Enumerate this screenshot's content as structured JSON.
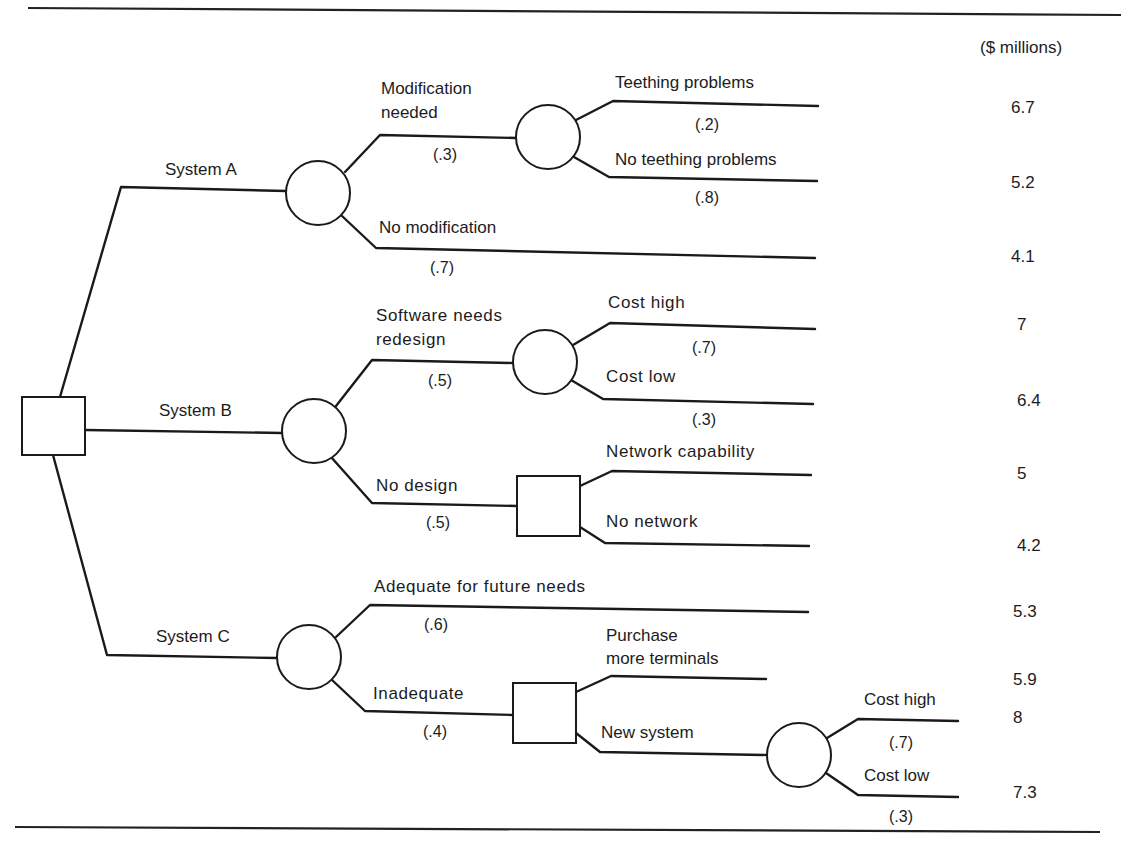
{
  "figure": {
    "units_label": "($ millions)",
    "title_visible": false
  },
  "root": {
    "type": "decision",
    "name": "Root decision"
  },
  "branches": {
    "system_a": {
      "label": "System A",
      "modification_needed": {
        "label": "Modification needed",
        "label_line1": "Modification",
        "label_line2": "needed",
        "prob": "(.3)",
        "teething": {
          "label": "Teething problems",
          "prob": "(.2)",
          "value": "6.7"
        },
        "no_teething": {
          "label": "No teething problems",
          "prob": "(.8)",
          "value": "5.2"
        }
      },
      "no_modification": {
        "label": "No modification",
        "prob": "(.7)",
        "value": "4.1"
      }
    },
    "system_b": {
      "label": "System B",
      "software_redesign": {
        "label_line1": "Software needs",
        "label_line2": "redesign",
        "prob": "(.5)",
        "cost_high": {
          "label": "Cost high",
          "prob": "(.7)",
          "value": "7"
        },
        "cost_low": {
          "label": "Cost low",
          "prob": "(.3)",
          "value": "6.4"
        }
      },
      "no_design": {
        "label": "No design",
        "prob": "(.5)",
        "network_capability": {
          "label": "Network capability",
          "value": "5"
        },
        "no_network": {
          "label": "No network",
          "value": "4.2"
        }
      }
    },
    "system_c": {
      "label": "System C",
      "adequate": {
        "label": "Adequate for future needs",
        "prob": "(.6)",
        "value": "5.3"
      },
      "inadequate": {
        "label": "Inadequate",
        "prob": "(.4)",
        "purchase_terminals": {
          "label_line1": "Purchase",
          "label_line2": "more terminals",
          "value": "5.9"
        },
        "new_system": {
          "label": "New system",
          "cost_high": {
            "label": "Cost high",
            "prob": "(.7)",
            "value": "8"
          },
          "cost_low": {
            "label": "Cost low",
            "prob": "(.3)",
            "value": "7.3"
          }
        }
      }
    }
  }
}
